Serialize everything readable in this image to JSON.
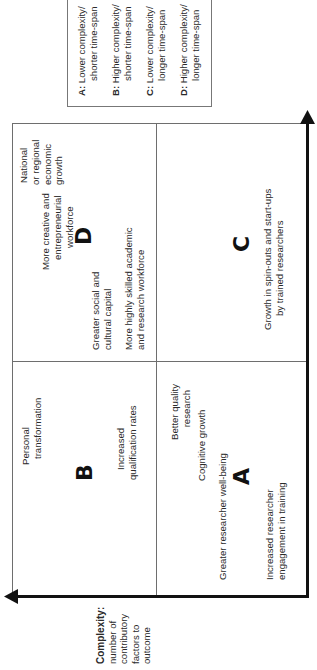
{
  "legend": {
    "items": [
      {
        "key": "A:",
        "line1": "Lower complexity/",
        "line2": "shorter time-span"
      },
      {
        "key": "B:",
        "line1": "Higher complexity/",
        "line2": "shorter time-span"
      },
      {
        "key": "C:",
        "line1": "Lower complexity/",
        "line2": "longer time-span"
      },
      {
        "key": "D:",
        "line1": "Higher complexity/",
        "line2": "longer time-span"
      }
    ]
  },
  "axes": {
    "y_axis": {
      "title": "Complexity:",
      "lines": [
        "number of",
        "contributory",
        "factors to",
        "outcome"
      ]
    }
  },
  "quadrants": {
    "A": {
      "letter": "A",
      "outcomes": {
        "better_quality_research": [
          "Better quality",
          "research"
        ],
        "cognitive_growth": [
          "Cognitive growth"
        ],
        "greater_wellbeing": [
          "Greater researcher well-being"
        ],
        "increased_engagement": [
          "Increased researcher",
          "engagement in training"
        ]
      }
    },
    "B": {
      "letter": "B",
      "outcomes": {
        "personal_transformation": [
          "Personal",
          "transformation"
        ],
        "increased_qualification": [
          "Increased",
          "qualification rates"
        ]
      }
    },
    "C": {
      "letter": "C",
      "outcomes": {
        "spinouts": [
          "Growth in spin-outs and start-ups",
          "by trained researchers"
        ]
      }
    },
    "D": {
      "letter": "D",
      "outcomes": {
        "national_growth": [
          "National",
          "or regional",
          "economic",
          "growth"
        ],
        "creative_workforce": [
          "More creative and",
          "entrepreneurial",
          "workforce"
        ],
        "social_capital": [
          "Greater social and",
          "cultural capital"
        ],
        "skilled_workforce": [
          "More highly skilled academic",
          "and research workforce"
        ]
      }
    }
  },
  "colors": {
    "axis": "#111111",
    "divider": "#6e6e6e",
    "text": "#2a2a2a",
    "background": "#ffffff"
  }
}
